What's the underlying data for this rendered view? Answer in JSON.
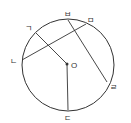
{
  "diagram": {
    "center_label": "O",
    "points": {
      "g": "ㄱ",
      "n": "ㄴ",
      "d": "ㄷ",
      "r": "ㄹ",
      "m": "ㅁ",
      "b": "ㅂ"
    },
    "segments": [
      {
        "from": "ㄱ",
        "to": "O"
      },
      {
        "from": "O",
        "to": "ㄷ"
      },
      {
        "from": "ㄴ",
        "to": "ㅁ"
      },
      {
        "from": "ㅂ",
        "to": "ㄹ"
      }
    ],
    "colors": {
      "stroke": "#333333",
      "background": "#ffffff"
    }
  }
}
